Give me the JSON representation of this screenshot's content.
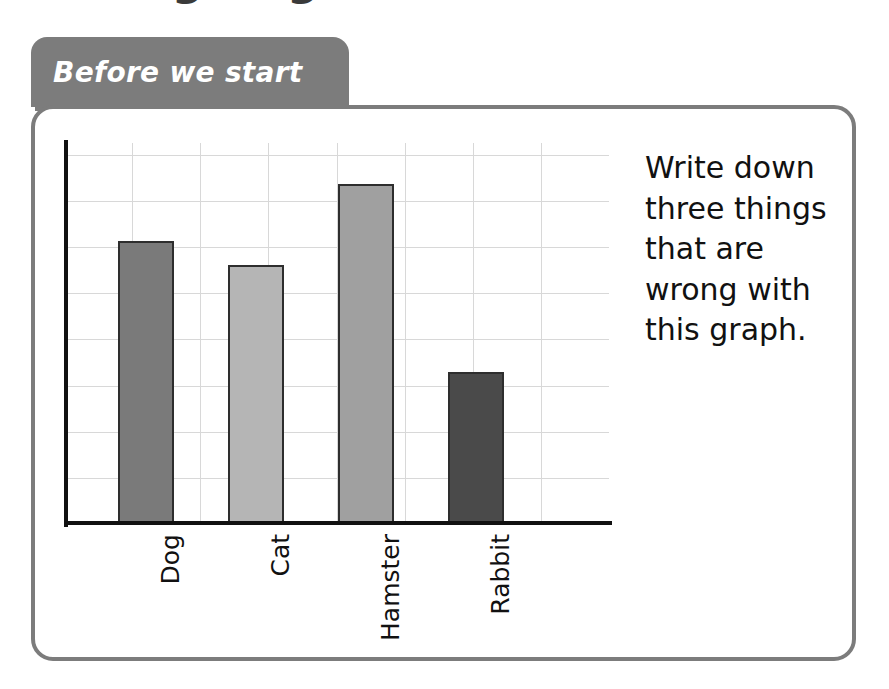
{
  "page": {
    "clipped_title": "ng ... g"
  },
  "tab": {
    "label": "Before we start"
  },
  "instruction": {
    "text": "Write down three things that are wrong with this graph."
  },
  "colors": {
    "tab_background": "#7c7c7c",
    "card_border": "#7c7c7c",
    "axis": "#111111",
    "gridline": "#d8d8d8",
    "bar_outline": "#2e2e2e"
  },
  "chart_data": {
    "type": "bar",
    "title": "",
    "xlabel": "",
    "ylabel": "",
    "categories": [
      "Dog",
      "Cat",
      "Hamster",
      "Rabbit"
    ],
    "values": [
      6.13,
      5.61,
      7.37,
      3.3
    ],
    "bar_colors": [
      "#7a7a7a",
      "#b5b5b5",
      "#a0a0a0",
      "#4a4a4a"
    ],
    "ylim": [
      0,
      8.26
    ],
    "grid": true,
    "y_tick_labels": [],
    "x_tick_labels": [
      "Dog",
      "Cat",
      "Hamster",
      "Rabbit"
    ],
    "legend": "none"
  }
}
